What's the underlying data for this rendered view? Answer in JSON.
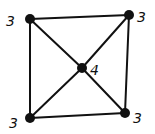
{
  "diagram": {
    "type": "graph",
    "nodes": [
      {
        "id": "tl",
        "x": 30,
        "y": 19,
        "label": "3",
        "lx": 6,
        "ly": 26
      },
      {
        "id": "tr",
        "x": 129,
        "y": 15,
        "label": "3",
        "lx": 137,
        "ly": 22
      },
      {
        "id": "bl",
        "x": 30,
        "y": 118,
        "label": "3",
        "lx": 9,
        "ly": 128
      },
      {
        "id": "br",
        "x": 125,
        "y": 113,
        "label": "3",
        "lx": 133,
        "ly": 123
      },
      {
        "id": "c",
        "x": 82,
        "y": 68,
        "label": "4",
        "lx": 90,
        "ly": 75
      }
    ],
    "edges": [
      [
        "tl",
        "tr"
      ],
      [
        "tr",
        "br"
      ],
      [
        "br",
        "bl"
      ],
      [
        "bl",
        "tl"
      ],
      [
        "tl",
        "c"
      ],
      [
        "c",
        "br"
      ],
      [
        "tr",
        "c"
      ],
      [
        "c",
        "bl"
      ]
    ],
    "colors": {
      "stroke": "#111111",
      "background": "#ffffff"
    }
  }
}
